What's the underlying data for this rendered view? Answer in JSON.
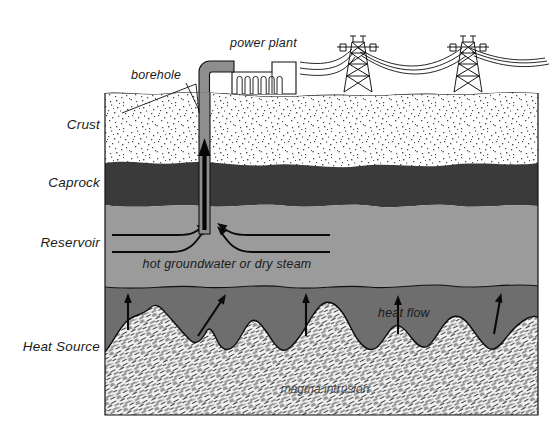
{
  "figure": {
    "background": "#ffffff"
  },
  "layer_labels": [
    {
      "id": "crust",
      "text": "Crust",
      "x": 100,
      "y": 129
    },
    {
      "id": "caprock",
      "text": "Caprock",
      "x": 100,
      "y": 187
    },
    {
      "id": "reservoir",
      "text": "Reservoir",
      "x": 100,
      "y": 247
    },
    {
      "id": "heat-source",
      "text": "Heat Source",
      "x": 100,
      "y": 351
    }
  ],
  "callouts": {
    "borehole": {
      "text": "borehole",
      "x": 131,
      "y": 79
    },
    "power_plant": {
      "text": "power plant",
      "x": 230,
      "y": 47
    },
    "reservoir_fluid": {
      "text": "hot groundwater or dry steam",
      "x": 227,
      "y": 268
    },
    "heat_flow": {
      "text": "heat flow",
      "x": 378,
      "y": 317
    },
    "magma": {
      "text": "magma intrusion",
      "x": 325,
      "y": 393
    }
  },
  "colors": {
    "crust_fill": "#ffffff",
    "crust_stipple": "#555555",
    "caprock_fill": "#3a3a3a",
    "reservoir_fill": "#9b9b9b",
    "heat_source_fill": "#6e6e6e",
    "magma_fill": "#efefef",
    "magma_hatch": "#3b3b3b",
    "pipe_fill": "#8e8e8e",
    "outline": "#000000",
    "plant_fill": "#ffffff"
  },
  "geometry": {
    "block": {
      "x": 105,
      "y": 93,
      "width": 433,
      "height": 322
    },
    "ground_surface_y": 93,
    "caprock_top_y": 162,
    "caprock_bottom_y": 203,
    "heat_source_top_y": 281,
    "block_bottom_y": 415,
    "borehole": {
      "x": 205,
      "top_y": 64,
      "bottom_y": 232,
      "width": 11
    }
  }
}
